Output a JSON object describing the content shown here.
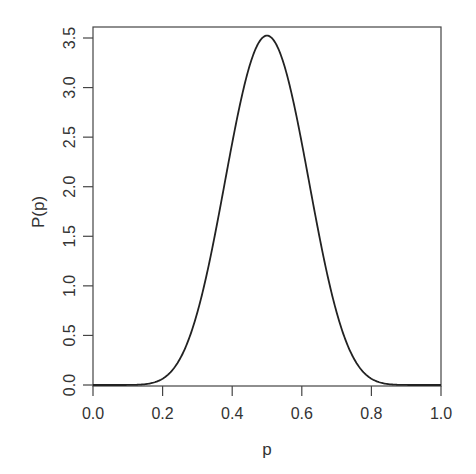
{
  "chart_data": {
    "type": "line",
    "title": "",
    "xlabel": "p",
    "ylabel": "P(p)",
    "xlim": [
      0.0,
      1.0
    ],
    "ylim": [
      0.0,
      3.5
    ],
    "xticks": [
      "0.0",
      "0.2",
      "0.4",
      "0.6",
      "0.8",
      "1.0"
    ],
    "yticks": [
      "0.0",
      "0.5",
      "1.0",
      "1.5",
      "2.0",
      "2.5",
      "3.0",
      "3.5"
    ],
    "grid": false,
    "legend": null,
    "series": [
      {
        "name": "density",
        "x": [
          0.0,
          0.1,
          0.15,
          0.2,
          0.25,
          0.3,
          0.35,
          0.4,
          0.45,
          0.5,
          0.55,
          0.6,
          0.65,
          0.7,
          0.75,
          0.8,
          0.85,
          0.9,
          1.0
        ],
        "y": [
          0.0,
          0.0,
          0.01,
          0.07,
          0.3,
          0.76,
          1.5,
          2.35,
          3.1,
          3.52,
          3.1,
          2.35,
          1.5,
          0.76,
          0.3,
          0.07,
          0.01,
          0.0,
          0.0
        ]
      }
    ],
    "color": "#222222"
  }
}
